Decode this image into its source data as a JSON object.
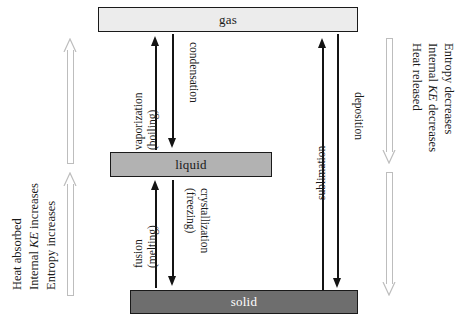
{
  "diagram": {
    "colors": {
      "gas_fill": "#ececec",
      "liquid_fill": "#b2b2b2",
      "solid_fill": "#6e6e6e",
      "box_border": "#1a1a1a",
      "arrow_black": "#141414",
      "arrow_grey": "#bdbdbd",
      "background": "#ffffff"
    }
  },
  "phases": {
    "gas": "gas",
    "liquid": "liquid",
    "solid": "solid"
  },
  "transitions": {
    "vaporization": {
      "line1": "vaporization",
      "line2": "(boiling)",
      "direction": "up",
      "from": "liquid",
      "to": "gas"
    },
    "condensation": {
      "line1": "condensation",
      "line2": "",
      "direction": "down",
      "from": "gas",
      "to": "liquid"
    },
    "fusion": {
      "line1": "fusion",
      "line2": "(melting)",
      "direction": "up",
      "from": "solid",
      "to": "liquid"
    },
    "crystallization": {
      "line1": "crystallization",
      "line2": "(freezing)",
      "direction": "down",
      "from": "liquid",
      "to": "solid"
    },
    "sublimation": {
      "line1": "sublimation",
      "line2": "",
      "direction": "up",
      "from": "solid",
      "to": "gas"
    },
    "deposition": {
      "line1": "deposition",
      "line2": "",
      "direction": "down",
      "from": "gas",
      "to": "solid"
    }
  },
  "side_notes": {
    "left": {
      "direction": "up",
      "lines": [
        {
          "pre": "Heat absorbed",
          "em": "",
          "post": ""
        },
        {
          "pre": "Internal ",
          "em": "KE",
          "post": " increases"
        },
        {
          "pre": "Entropy increases",
          "em": "",
          "post": ""
        }
      ]
    },
    "right": {
      "direction": "down",
      "lines": [
        {
          "pre": "Heat released",
          "em": "",
          "post": ""
        },
        {
          "pre": "Internal ",
          "em": "KE",
          "post": " decreases"
        },
        {
          "pre": "Entropy decreases",
          "em": "",
          "post": ""
        }
      ]
    }
  }
}
